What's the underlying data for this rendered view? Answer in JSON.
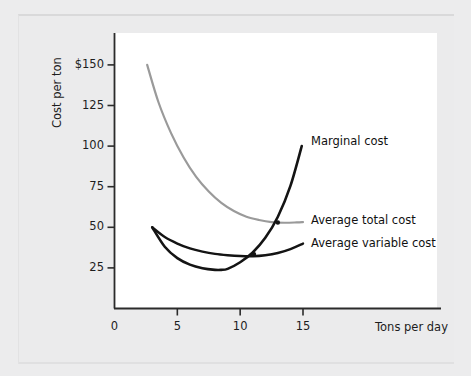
{
  "figure": {
    "background_color": "#ebebec",
    "plot_background_color": "#ffffff"
  },
  "chart_data": {
    "type": "line",
    "title": "",
    "xlabel": "Tons per day",
    "ylabel": "Cost per ton",
    "xlim": [
      0,
      25.6
    ],
    "ylim": [
      0,
      169
    ],
    "grid": false,
    "legend_position": "inline-right-of-curves",
    "xticks": [
      "0",
      "5",
      "10",
      "15"
    ],
    "xtick_values": [
      0,
      5,
      10,
      15
    ],
    "yticks": [
      "$150",
      "125",
      "100",
      "75",
      "50",
      "25"
    ],
    "ytick_values": [
      150,
      125,
      100,
      75,
      50,
      25
    ],
    "axis_origin_label": "0",
    "series": [
      {
        "name": "Average total cost",
        "color": "#9a9a9a",
        "width": 2.2,
        "label": "Average total cost",
        "x": [
          2.6,
          3.5,
          4.5,
          5.5,
          6.5,
          7.5,
          8.5,
          9.5,
          10.5,
          11.5,
          12.5,
          13.5,
          14.5,
          15.0
        ],
        "y": [
          150,
          127,
          108,
          93,
          81,
          72,
          65,
          60,
          56.5,
          54.5,
          53.2,
          52.8,
          53.0,
          53.2
        ]
      },
      {
        "name": "Average variable cost",
        "color": "#141414",
        "width": 2.4,
        "label": "Average variable cost",
        "x": [
          3.0,
          4.0,
          5.0,
          6.0,
          7.0,
          8.0,
          9.0,
          10.0,
          11.0,
          12.0,
          13.0,
          14.0,
          15.0
        ],
        "y": [
          50,
          44,
          40,
          37,
          35,
          33.6,
          32.8,
          32.3,
          32.2,
          32.8,
          34.2,
          36.6,
          40.0
        ]
      },
      {
        "name": "Marginal cost",
        "color": "#141414",
        "width": 2.6,
        "label": "Marginal cost",
        "x": [
          3.0,
          4.0,
          5.0,
          6.0,
          7.0,
          8.0,
          8.5,
          9.0,
          10.0,
          11.0,
          12.0,
          13.0,
          14.0,
          14.9
        ],
        "y": [
          50,
          38,
          31,
          27,
          24.8,
          23.8,
          23.8,
          24.4,
          28.5,
          34.5,
          43.5,
          56.5,
          75.5,
          100
        ]
      }
    ],
    "intersections": [
      {
        "label": "MC crosses AVC",
        "x": 11.1,
        "y": 33.5
      },
      {
        "label": "MC crosses ATC",
        "x": 13.0,
        "y": 53.0
      }
    ]
  },
  "labels": {
    "marginal_cost": "Marginal cost",
    "average_total_cost": "Average total cost",
    "average_variable_cost": "Average variable cost"
  }
}
